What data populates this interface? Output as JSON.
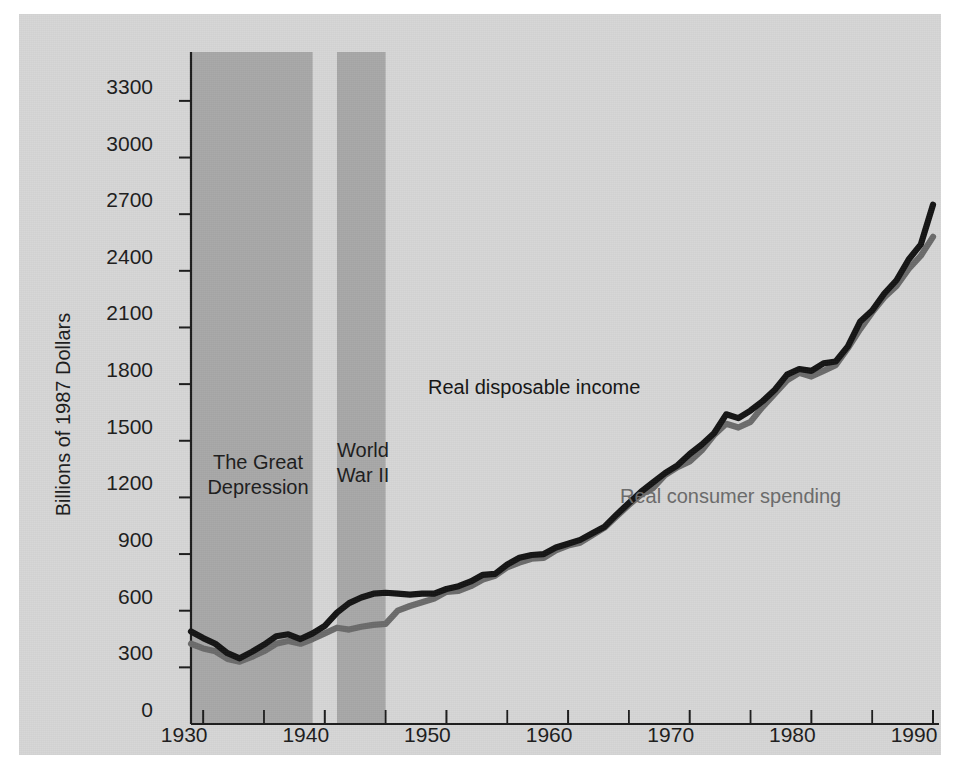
{
  "figure": {
    "background_color": "#d6d6d6",
    "band_color": "#a8a8a8",
    "ylabel": "Billions of 1987 Dollars"
  },
  "annotations": {
    "great_depression": "The Great\nDepression",
    "world_war_ii": "World\nWar II",
    "income_label": "Real disposable income",
    "spending_label": "Real consumer spending"
  },
  "chart_data": {
    "type": "line",
    "title": "",
    "xlabel": "",
    "ylabel": "Billions of 1987 Dollars",
    "xlim": [
      1929,
      1990
    ],
    "ylim": [
      0,
      3400
    ],
    "yticks": [
      0,
      300,
      600,
      900,
      1200,
      1500,
      1800,
      2100,
      2400,
      2700,
      3000,
      3300
    ],
    "ytick_labels": [
      "0",
      "300",
      "600",
      "900",
      "1200",
      "1500",
      "1800",
      "2100",
      "2400",
      "2700",
      "3000",
      "3300"
    ],
    "xticks": [
      1930,
      1940,
      1950,
      1960,
      1970,
      1980,
      1990
    ],
    "xtick_labels": [
      "1930",
      "1940",
      "1950",
      "1960",
      "1970",
      "1980",
      "1990"
    ],
    "xminor_ticks": [
      1935,
      1945,
      1955,
      1965,
      1975,
      1985
    ],
    "grid": false,
    "legend_position": "inline-annotation",
    "shaded_regions": [
      {
        "label": "The Great Depression",
        "x0": 1929,
        "x1": 1939,
        "color": "#a8a8a8"
      },
      {
        "label": "World War II",
        "x0": 1941,
        "x1": 1945,
        "color": "#a8a8a8"
      }
    ],
    "x": [
      1929,
      1930,
      1931,
      1932,
      1933,
      1934,
      1935,
      1936,
      1937,
      1938,
      1939,
      1940,
      1941,
      1942,
      1943,
      1944,
      1945,
      1946,
      1947,
      1948,
      1949,
      1950,
      1951,
      1952,
      1953,
      1954,
      1955,
      1956,
      1957,
      1958,
      1959,
      1960,
      1961,
      1962,
      1963,
      1964,
      1965,
      1966,
      1967,
      1968,
      1969,
      1970,
      1971,
      1972,
      1973,
      1974,
      1975,
      1976,
      1977,
      1978,
      1979,
      1980,
      1981,
      1982,
      1983,
      1984,
      1985,
      1986,
      1987,
      1988,
      1989,
      1990
    ],
    "series": [
      {
        "name": "Real disposable income",
        "color": "#141414",
        "values": [
          490,
          455,
          425,
          375,
          348,
          382,
          420,
          465,
          475,
          450,
          480,
          520,
          590,
          640,
          670,
          690,
          695,
          690,
          685,
          690,
          690,
          715,
          730,
          755,
          790,
          795,
          845,
          880,
          895,
          900,
          935,
          955,
          975,
          1010,
          1045,
          1110,
          1170,
          1230,
          1280,
          1330,
          1370,
          1430,
          1480,
          1540,
          1640,
          1620,
          1660,
          1710,
          1770,
          1850,
          1880,
          1870,
          1910,
          1920,
          2000,
          2130,
          2190,
          2280,
          2350,
          2460,
          2540,
          2750
        ]
      },
      {
        "name": "Real consumer spending",
        "color": "#6b6b6b",
        "values": [
          425,
          400,
          385,
          345,
          330,
          355,
          385,
          425,
          440,
          425,
          450,
          480,
          510,
          500,
          515,
          525,
          530,
          600,
          625,
          645,
          665,
          700,
          705,
          730,
          765,
          785,
          830,
          855,
          875,
          880,
          920,
          945,
          960,
          1000,
          1040,
          1100,
          1160,
          1215,
          1250,
          1320,
          1360,
          1390,
          1450,
          1530,
          1590,
          1570,
          1600,
          1680,
          1750,
          1820,
          1860,
          1840,
          1870,
          1900,
          1990,
          2090,
          2180,
          2260,
          2320,
          2410,
          2480,
          2580
        ]
      }
    ]
  }
}
